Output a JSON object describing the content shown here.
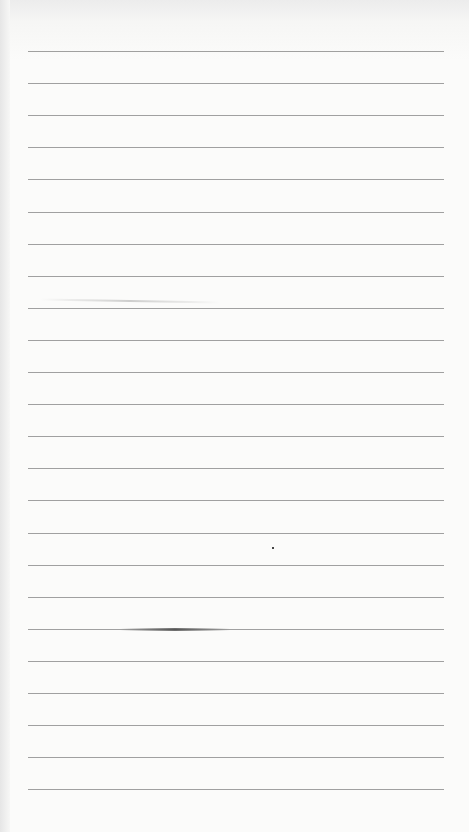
{
  "sheet": {
    "type": "lined-paper",
    "background": "#fbfbfa",
    "rule_color": "#8f8f8f",
    "rule_count": 24,
    "rule_start_y": 51,
    "rule_spacing": 32.1,
    "rule_left": 28,
    "rule_width": 416
  }
}
